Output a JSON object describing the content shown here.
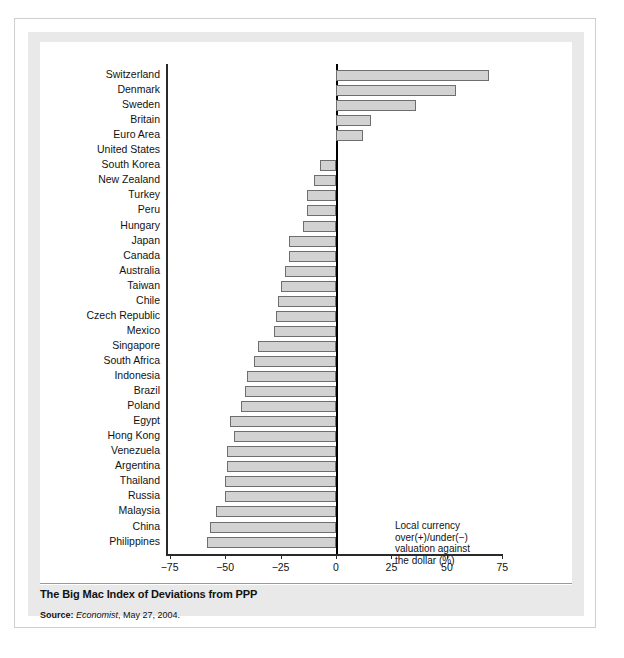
{
  "chart_data": {
    "type": "bar",
    "orientation": "horizontal",
    "title": "The Big Mac Index of Deviations from PPP",
    "xlabel": "Local currency over(+)/under(−) valuation against the dollar (%)",
    "ylabel": "",
    "xlim": [
      -85,
      80
    ],
    "xticks": [
      -75,
      -50,
      -25,
      0,
      25,
      50,
      75
    ],
    "xticklabels": [
      "−75",
      "−50",
      "−25",
      "0",
      "25",
      "50",
      "75"
    ],
    "grid": false,
    "legend": null,
    "categories": [
      "Switzerland",
      "Denmark",
      "Sweden",
      "Britain",
      "Euro Area",
      "United States",
      "South Korea",
      "New Zealand",
      "Turkey",
      "Peru",
      "Hungary",
      "Japan",
      "Canada",
      "Australia",
      "Taiwan",
      "Chile",
      "Czech Republic",
      "Mexico",
      "Singapore",
      "South Africa",
      "Indonesia",
      "Brazil",
      "Poland",
      "Egypt",
      "Hong Kong",
      "Venezuela",
      "Argentina",
      "Thailand",
      "Russia",
      "Malaysia",
      "China",
      "Philippines"
    ],
    "values": [
      69,
      54,
      36,
      16,
      12,
      0,
      -7,
      -10,
      -13,
      -13,
      -15,
      -21,
      -21,
      -23,
      -25,
      -26,
      -27,
      -28,
      -35,
      -37,
      -40,
      -41,
      -43,
      -48,
      -46,
      -49,
      -49,
      -50,
      -50,
      -54,
      -57,
      -58
    ],
    "bar_color": "#d2d2d2",
    "bar_edge_color": "#6e6e6e"
  },
  "annotation": {
    "line1": "Local currency",
    "line2": "over(+)/under(−)",
    "line3": "valuation against",
    "line4": "the dollar (%)"
  },
  "caption": {
    "title": "The Big Mac Index of Deviations from PPP",
    "source_label": "Source:",
    "source_publication": "Economist",
    "source_rest": ", May 27, 2004."
  },
  "colors": {
    "page_background": "#ffffff",
    "panel_background": "#e9e9e9",
    "plot_background": "#ffffff",
    "axis": "#2a2a2a",
    "text": "#121212"
  }
}
